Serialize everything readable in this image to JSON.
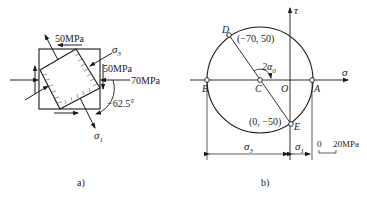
{
  "figure_a": {
    "caption": "a)",
    "labels": {
      "top_shear": "50MPa",
      "right_shear": "50MPa",
      "right_normal": "70MPa",
      "angle": "−62.5°",
      "sigma3": "σ",
      "sigma3_sub": "3",
      "sigma1": "σ",
      "sigma1_sub": "1"
    }
  },
  "figure_b": {
    "caption": "b)",
    "axes": {
      "x_label": "σ",
      "y_label": "τ",
      "origin": "O"
    },
    "points": {
      "D": {
        "name": "D",
        "coords": "(−70, 50)"
      },
      "E": {
        "name": "E",
        "coords": "(0, −50)"
      },
      "A": {
        "name": "A"
      },
      "B": {
        "name": "B"
      },
      "C": {
        "name": "C"
      }
    },
    "angle_label": "2α",
    "angle_sub": "0",
    "dims": {
      "sigma3": "σ",
      "sigma3_sub": "3",
      "sigma1": "σ",
      "sigma1_sub": "1"
    },
    "scale": {
      "zero": "0",
      "value": "20MPa"
    }
  }
}
